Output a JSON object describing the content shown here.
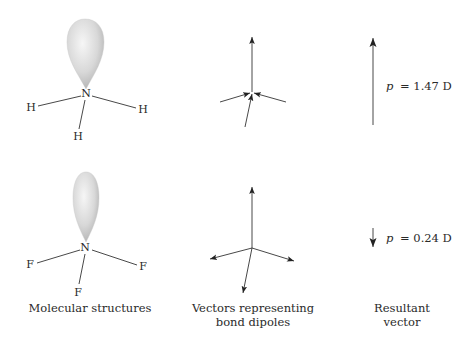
{
  "diagram": {
    "colors": {
      "line": "#333333",
      "arrow": "#222222",
      "lobe_light": "#f4f4f4",
      "lobe_mid": "#d6d6d6",
      "lobe_dark": "#a8a8a8",
      "text": "#2a2a2a"
    },
    "molecules": [
      {
        "name": "NH3",
        "central_atom": "N",
        "substituents": [
          "H",
          "H",
          "H"
        ],
        "resultant_label_symbol": "p",
        "resultant_label_value": "= 1.47 D",
        "resultant_direction": "up"
      },
      {
        "name": "NF3",
        "central_atom": "N",
        "substituents": [
          "F",
          "F",
          "F"
        ],
        "resultant_label_symbol": "p",
        "resultant_label_value": "= 0.24 D",
        "resultant_direction": "down"
      }
    ],
    "captions": {
      "structures": "Molecular structures",
      "vectors_line1": "Vectors representing",
      "vectors_line2": "bond dipoles",
      "resultant_line1": "Resultant",
      "resultant_line2": "vector"
    }
  }
}
